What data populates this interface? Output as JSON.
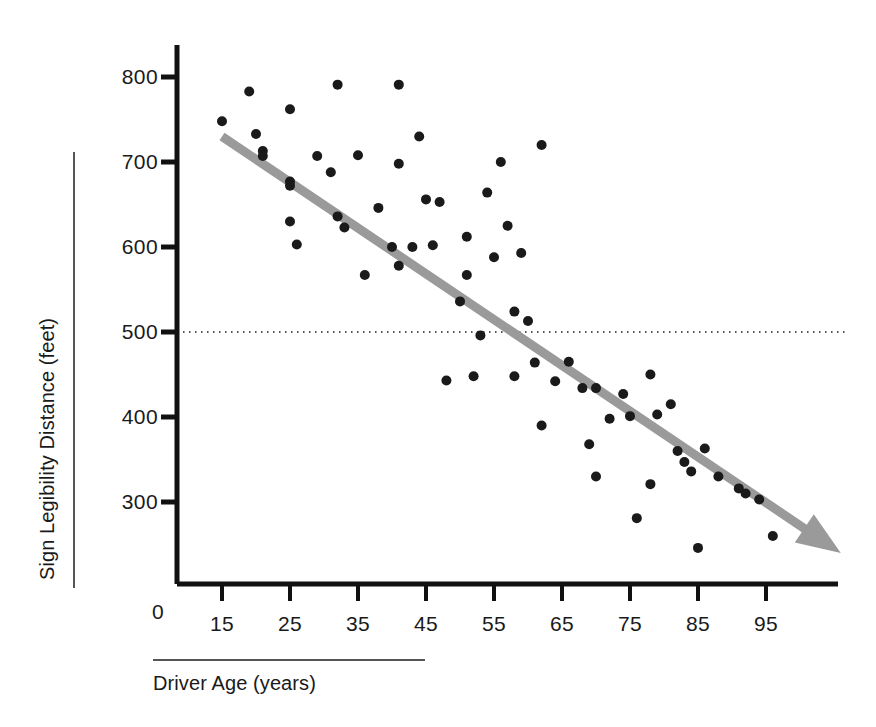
{
  "chart_data": {
    "type": "scatter",
    "title": "",
    "xlabel": "Driver Age (years)",
    "ylabel": "Sign Legibility Distance (feet)",
    "xlim": [
      10,
      102
    ],
    "ylim": [
      175,
      830
    ],
    "grid": false,
    "legend": "none",
    "x_ticks": [
      15,
      25,
      35,
      45,
      55,
      65,
      75,
      85,
      95
    ],
    "y_ticks": [
      300,
      400,
      500,
      600,
      700,
      800
    ],
    "y_origin_label": "0",
    "reference_line": {
      "axis": "y",
      "value": 500,
      "style": "dotted",
      "color": "#555555"
    },
    "trend_line": {
      "style": "solid-arrow",
      "color": "#9a9a9a",
      "width": 9,
      "x_start": 15,
      "y_start": 730,
      "x_end": 106,
      "y_end": 240
    },
    "point_color": "#1a1a1a",
    "point_radius": 5,
    "points": [
      [
        15,
        748
      ],
      [
        19,
        783
      ],
      [
        20,
        733
      ],
      [
        21,
        713
      ],
      [
        21,
        707
      ],
      [
        25,
        762
      ],
      [
        25,
        677
      ],
      [
        25,
        672
      ],
      [
        25,
        630
      ],
      [
        26,
        603
      ],
      [
        29,
        707
      ],
      [
        32,
        791
      ],
      [
        31,
        688
      ],
      [
        32,
        636
      ],
      [
        33,
        623
      ],
      [
        35,
        708
      ],
      [
        36,
        567
      ],
      [
        38,
        646
      ],
      [
        40,
        600
      ],
      [
        41,
        791
      ],
      [
        41,
        698
      ],
      [
        41,
        578
      ],
      [
        43,
        600
      ],
      [
        44,
        730
      ],
      [
        45,
        656
      ],
      [
        46,
        602
      ],
      [
        47,
        653
      ],
      [
        48,
        443
      ],
      [
        50,
        536
      ],
      [
        51,
        612
      ],
      [
        51,
        567
      ],
      [
        52,
        448
      ],
      [
        53,
        496
      ],
      [
        54,
        664
      ],
      [
        55,
        588
      ],
      [
        56,
        700
      ],
      [
        57,
        625
      ],
      [
        58,
        448
      ],
      [
        58,
        524
      ],
      [
        59,
        593
      ],
      [
        60,
        513
      ],
      [
        61,
        464
      ],
      [
        62,
        720
      ],
      [
        62,
        390
      ],
      [
        64,
        442
      ],
      [
        66,
        465
      ],
      [
        68,
        434
      ],
      [
        69,
        368
      ],
      [
        70,
        434
      ],
      [
        70,
        330
      ],
      [
        72,
        398
      ],
      [
        74,
        427
      ],
      [
        75,
        401
      ],
      [
        76,
        281
      ],
      [
        78,
        450
      ],
      [
        78,
        321
      ],
      [
        79,
        403
      ],
      [
        81,
        415
      ],
      [
        82,
        360
      ],
      [
        83,
        347
      ],
      [
        84,
        336
      ],
      [
        85,
        246
      ],
      [
        86,
        363
      ],
      [
        88,
        330
      ],
      [
        91,
        316
      ],
      [
        92,
        310
      ],
      [
        94,
        303
      ],
      [
        96,
        260
      ]
    ]
  },
  "axes": {
    "y_tick_labels": [
      "800",
      "700",
      "600",
      "500",
      "400",
      "300"
    ],
    "x_tick_labels": [
      "15",
      "25",
      "35",
      "45",
      "55",
      "65",
      "75",
      "85",
      "95"
    ],
    "origin_label": "0"
  }
}
